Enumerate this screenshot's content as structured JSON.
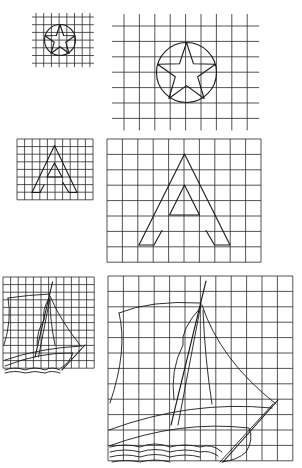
{
  "colors": {
    "ink": "#1a1a1a",
    "grid": "#2a2a2a",
    "background": "#ffffff"
  },
  "panels": [
    {
      "id": "star-small",
      "subject": "star in circle",
      "scale": "small",
      "grid": {
        "x0": 36,
        "y0": 17,
        "cols": 7,
        "rows": 6,
        "cell": 7.7,
        "extend": 4
      }
    },
    {
      "id": "star-large",
      "subject": "star in circle",
      "scale": "large",
      "grid": {
        "x0": 124,
        "y0": 26,
        "cols": 8,
        "rows": 6,
        "cell": 15.4,
        "extend": 12
      }
    },
    {
      "id": "letter-a-small",
      "subject": "letter A",
      "scale": "small",
      "grid": {
        "x0": 17,
        "y0": 139,
        "cols": 10,
        "rows": 8,
        "cell": 7.6,
        "extend": 0
      }
    },
    {
      "id": "letter-a-large",
      "subject": "letter A",
      "scale": "large",
      "grid": {
        "x0": 107,
        "y0": 139,
        "cols": 10,
        "rows": 8,
        "cell": 15.4,
        "extend": 0
      }
    },
    {
      "id": "ship-small",
      "subject": "sailing ship",
      "scale": "small",
      "grid": {
        "x0": 3,
        "y0": 277,
        "cols": 12,
        "rows": 12,
        "cell": 7.6,
        "extend": 0
      }
    },
    {
      "id": "ship-large",
      "subject": "sailing ship",
      "scale": "large",
      "grid": {
        "x0": 108,
        "y0": 276,
        "cols": 12,
        "rows": 12,
        "cell": 15.4,
        "extend": 0
      }
    }
  ]
}
